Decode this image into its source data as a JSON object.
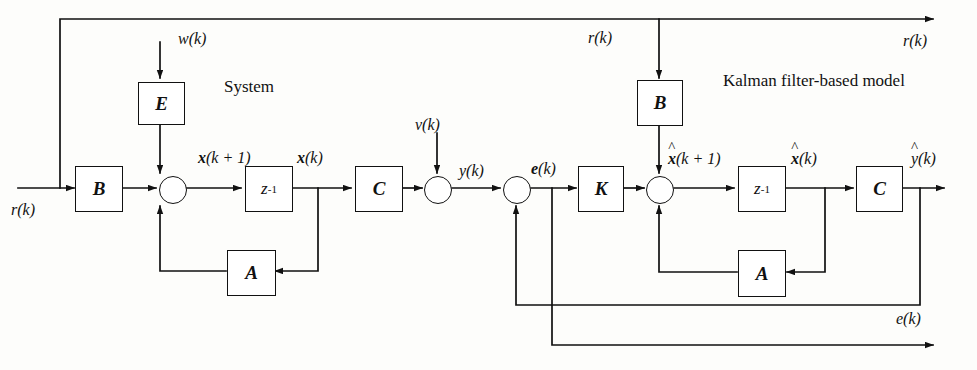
{
  "diagram": {
    "title_system": "System",
    "title_kalman": "Kalman filter-based model",
    "blocks": {
      "e_gain": "E",
      "b_left": "B",
      "delay_left": "z",
      "delay_left_exp": "-1",
      "a_left": "A",
      "c_left": "C",
      "b_right": "B",
      "k_gain": "K",
      "delay_right": "z",
      "delay_right_exp": "-1",
      "a_right": "A",
      "c_right": "C"
    },
    "signals": {
      "w_k": "w(k)",
      "r_k_input": "r(k)",
      "r_k_top_mid": "r(k)",
      "r_k_top_right": "r(k)",
      "x_k_plus_1": "x(k + 1)",
      "x_k": "x(k)",
      "v_k": "v(k)",
      "y_k": "y(k)",
      "e_k": "e(k)",
      "xhat_k_plus_1": "x(k + 1)",
      "xhat_k": "x(k)",
      "yhat_k": "y(k)",
      "e_k_out": "e(k)"
    },
    "colors": {
      "line": "#111111",
      "background": "#fdfdfb",
      "text": "#111111"
    }
  }
}
